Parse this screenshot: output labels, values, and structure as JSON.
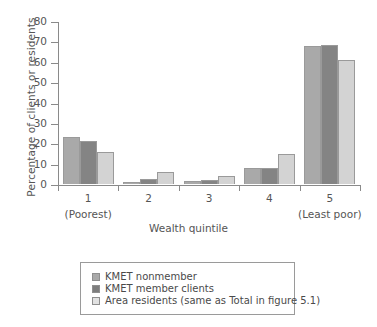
{
  "chart_data": {
    "type": "bar",
    "title": "",
    "xlabel": "Wealth quintile",
    "ylabel": "Percentage of clients or residents",
    "ylim": [
      0,
      80
    ],
    "yticks": [
      0,
      10,
      20,
      30,
      40,
      50,
      60,
      70,
      80
    ],
    "grid": false,
    "legend_position": "bottom",
    "categories": [
      "1",
      "2",
      "3",
      "4",
      "5"
    ],
    "category_sublabels": [
      "(Poorest)",
      "",
      "",
      "",
      "(Least poor)"
    ],
    "series": [
      {
        "name": "KMET nonmember",
        "color": "#a9a9a9",
        "values": [
          23,
          1,
          1.5,
          8,
          67.5
        ]
      },
      {
        "name": "KMET member clients",
        "color": "#848484",
        "values": [
          21,
          2.7,
          2,
          8,
          68
        ]
      },
      {
        "name": "Area residents (same as Total in figure 5.1)",
        "color": "#d3d3d3",
        "values": [
          15.5,
          6,
          4,
          14.5,
          61
        ]
      }
    ]
  }
}
